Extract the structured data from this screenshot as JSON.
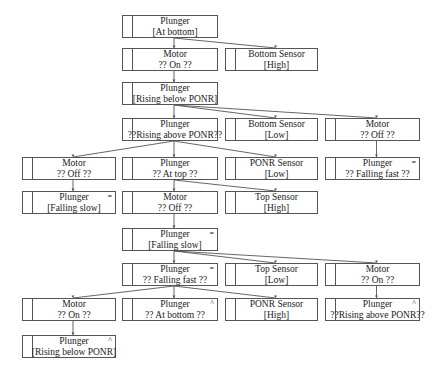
{
  "nodes": [
    {
      "id": "n0",
      "title": "Plunger",
      "state": "[At bottom]",
      "mark": "",
      "x": 122,
      "y": 15,
      "w": 96
    },
    {
      "id": "n1",
      "title": "Motor",
      "state": "?? On ??",
      "mark": "",
      "x": 122,
      "y": 48,
      "w": 96
    },
    {
      "id": "n2",
      "title": "Bottom Sensor",
      "state": "[High]",
      "mark": "",
      "x": 225,
      "y": 48,
      "w": 93
    },
    {
      "id": "n3",
      "title": "Plunger",
      "state": "[Rising below PONR]",
      "mark": "",
      "x": 122,
      "y": 82,
      "w": 96
    },
    {
      "id": "n4",
      "title": "Plunger",
      "state": "??Rising above PONR??",
      "mark": "",
      "x": 122,
      "y": 118,
      "w": 96
    },
    {
      "id": "n5",
      "title": "Bottom Sensor",
      "state": "[Low]",
      "mark": "",
      "x": 225,
      "y": 118,
      "w": 93
    },
    {
      "id": "n6",
      "title": "Motor",
      "state": "?? Off ??",
      "mark": "",
      "x": 325,
      "y": 118,
      "w": 95
    },
    {
      "id": "n7",
      "title": "Motor",
      "state": "?? Off ??",
      "mark": "",
      "x": 22,
      "y": 157,
      "w": 94
    },
    {
      "id": "n8",
      "title": "Plunger",
      "state": "?? At top ??",
      "mark": "",
      "x": 122,
      "y": 157,
      "w": 96
    },
    {
      "id": "n9",
      "title": "PONR Sensor",
      "state": "[Low]",
      "mark": "",
      "x": 225,
      "y": 157,
      "w": 93
    },
    {
      "id": "n10",
      "title": "Plunger",
      "state": "?? Falling fast ??",
      "mark": "=",
      "x": 325,
      "y": 157,
      "w": 95
    },
    {
      "id": "n11",
      "title": "Plunger",
      "state": "[Falling slow]",
      "mark": "=",
      "x": 22,
      "y": 191,
      "w": 94
    },
    {
      "id": "n12",
      "title": "Motor",
      "state": "?? Off ??",
      "mark": "",
      "x": 122,
      "y": 191,
      "w": 96
    },
    {
      "id": "n13",
      "title": "Top Sensor",
      "state": "[High]",
      "mark": "",
      "x": 225,
      "y": 191,
      "w": 93
    },
    {
      "id": "n14",
      "title": "Plunger",
      "state": "[Falling slow]",
      "mark": "=",
      "x": 122,
      "y": 228,
      "w": 96
    },
    {
      "id": "n15",
      "title": "Plunger",
      "state": "?? Falling fast ??",
      "mark": "=",
      "x": 122,
      "y": 263,
      "w": 96
    },
    {
      "id": "n16",
      "title": "Top Sensor",
      "state": "[Low]",
      "mark": "",
      "x": 225,
      "y": 263,
      "w": 93
    },
    {
      "id": "n17",
      "title": "Motor",
      "state": "?? On ??",
      "mark": "",
      "x": 325,
      "y": 263,
      "w": 95
    },
    {
      "id": "n18",
      "title": "Motor",
      "state": "?? On ??",
      "mark": "",
      "x": 22,
      "y": 298,
      "w": 94
    },
    {
      "id": "n19",
      "title": "Plunger",
      "state": "?? At bottom ??",
      "mark": "^",
      "x": 122,
      "y": 298,
      "w": 96
    },
    {
      "id": "n20",
      "title": "PONR Sensor",
      "state": "[High]",
      "mark": "",
      "x": 225,
      "y": 298,
      "w": 93
    },
    {
      "id": "n21",
      "title": "Plunger",
      "state": "??Rising above PONR??",
      "mark": "^",
      "x": 325,
      "y": 298,
      "w": 95
    },
    {
      "id": "n22",
      "title": "Plunger",
      "state": "[Rising below PONR]",
      "mark": "^",
      "x": 22,
      "y": 335,
      "w": 94
    }
  ],
  "edges": [
    [
      "n0",
      "n1"
    ],
    [
      "n0",
      "n2"
    ],
    [
      "n1",
      "n3"
    ],
    [
      "n3",
      "n4"
    ],
    [
      "n3",
      "n5"
    ],
    [
      "n3",
      "n6"
    ],
    [
      "n6",
      "n10"
    ],
    [
      "n4",
      "n7"
    ],
    [
      "n4",
      "n8"
    ],
    [
      "n4",
      "n9"
    ],
    [
      "n7",
      "n11"
    ],
    [
      "n8",
      "n12"
    ],
    [
      "n8",
      "n13"
    ],
    [
      "n12",
      "n14"
    ],
    [
      "n14",
      "n15"
    ],
    [
      "n14",
      "n16"
    ],
    [
      "n14",
      "n17"
    ],
    [
      "n17",
      "n21"
    ],
    [
      "n15",
      "n18"
    ],
    [
      "n15",
      "n19"
    ],
    [
      "n15",
      "n20"
    ],
    [
      "n18",
      "n22"
    ]
  ],
  "colors": {
    "line": "#555555",
    "text": "#222222",
    "background": "#ffffff"
  }
}
